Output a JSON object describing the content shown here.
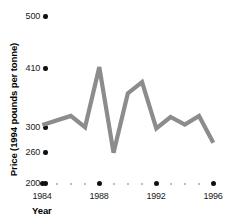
{
  "chart_data": {
    "type": "line",
    "title": "",
    "xlabel": "Year",
    "ylabel": "Price (1994 pounds per tonne)",
    "xlim": [
      1984,
      1996
    ],
    "ylim": [
      200,
      500
    ],
    "grid": false,
    "legend": "none",
    "line_color": "#8c8c8c",
    "axis_dot_color": "#111111",
    "minor_dot_color": "#a8a8a8",
    "y_ticks": [
      {
        "label": "500",
        "value": 500
      },
      {
        "label": "410",
        "value": 410
      },
      {
        "label": "300",
        "value": 300
      },
      {
        "label": "260",
        "value": 260
      },
      {
        "label": "200",
        "value": 200
      }
    ],
    "x_ticks": [
      {
        "label": "1984",
        "value": 1984
      },
      {
        "label": "1988",
        "value": 1988
      },
      {
        "label": "1992",
        "value": 1992
      },
      {
        "label": "1996",
        "value": 1996
      }
    ],
    "x": [
      1984,
      1986,
      1987,
      1988,
      1989,
      1990,
      1991,
      1992,
      1993,
      1994,
      1995,
      1996
    ],
    "values": [
      304,
      321,
      300,
      412,
      259,
      363,
      384,
      298,
      319,
      305,
      321,
      275
    ],
    "series": [
      {
        "name": "Price",
        "x": [
          1984,
          1986,
          1987,
          1988,
          1989,
          1990,
          1991,
          1992,
          1993,
          1994,
          1995,
          1996
        ],
        "values": [
          304,
          321,
          300,
          412,
          259,
          363,
          384,
          298,
          319,
          305,
          321,
          275
        ]
      }
    ]
  },
  "axis": {
    "y_title": "Price (1994 pounds per tonne)",
    "x_title": "Year",
    "y_labels": [
      "500",
      "410",
      "300",
      "260",
      "200"
    ],
    "x_labels": [
      "1984",
      "1988",
      "1992",
      "1996"
    ]
  }
}
